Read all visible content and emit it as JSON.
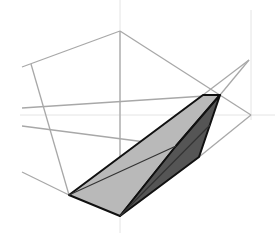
{
  "diagram": {
    "type": "3d-wireframe-projection",
    "background": "#ffffff",
    "colors": {
      "axis": "#e4e4e4",
      "wire": "#a8a8a8",
      "outline": "#111111",
      "light_face": "#b9b9b9",
      "dark_face": "#555555"
    },
    "axes": [
      {
        "name": "vertical-axis-center",
        "points": [
          [
            120,
            0
          ],
          [
            120,
            233
          ]
        ]
      },
      {
        "name": "vertical-axis-right",
        "points": [
          [
            251,
            10
          ],
          [
            251,
            120
          ]
        ]
      },
      {
        "name": "horizontal-axis",
        "points": [
          [
            20,
            115
          ],
          [
            275,
            115
          ]
        ]
      }
    ],
    "wire_lines": [
      {
        "name": "apex-to-left",
        "points": [
          [
            120,
            31
          ],
          [
            22,
            67
          ]
        ]
      },
      {
        "name": "apex-to-right",
        "points": [
          [
            120,
            31
          ],
          [
            251,
            115
          ]
        ]
      },
      {
        "name": "left-vertical",
        "points": [
          [
            31,
            64
          ],
          [
            69,
            195
          ]
        ]
      },
      {
        "name": "center-vertical",
        "points": [
          [
            120,
            31
          ],
          [
            120,
            216
          ]
        ]
      },
      {
        "name": "upper-crossline",
        "points": [
          [
            22,
            108
          ],
          [
            220,
            95
          ]
        ]
      },
      {
        "name": "middle-crossline",
        "points": [
          [
            22,
            126
          ],
          [
            176,
            146
          ]
        ]
      },
      {
        "name": "lower-left-line",
        "points": [
          [
            22,
            172
          ],
          [
            69,
            195
          ]
        ]
      },
      {
        "name": "right-to-dark-vertex",
        "points": [
          [
            251,
            115
          ],
          [
            199,
            157
          ]
        ]
      },
      {
        "name": "far-tip-to-light-top",
        "points": [
          [
            249,
            60
          ],
          [
            203,
            95
          ]
        ]
      },
      {
        "name": "far-tip-to-right-top",
        "points": [
          [
            249,
            60
          ],
          [
            220,
            95
          ]
        ]
      }
    ],
    "faces": [
      {
        "name": "light-face",
        "fill": "#b9b9b9",
        "points": [
          [
            69,
            195
          ],
          [
            203,
            95
          ],
          [
            220,
            95
          ],
          [
            176,
            146
          ],
          [
            120,
            216
          ]
        ]
      },
      {
        "name": "dark-face",
        "fill": "#555555",
        "points": [
          [
            220,
            95
          ],
          [
            199,
            157
          ],
          [
            120,
            216
          ],
          [
            176,
            146
          ]
        ]
      }
    ],
    "inner_lines": [
      {
        "name": "light-face-diagonal",
        "points": [
          [
            69,
            195
          ],
          [
            176,
            146
          ]
        ]
      },
      {
        "name": "dark-face-diagonal",
        "points": [
          [
            120,
            216
          ],
          [
            210,
            125
          ]
        ]
      }
    ]
  }
}
